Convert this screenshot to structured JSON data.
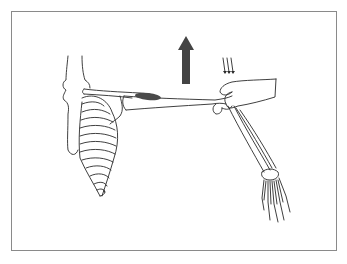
{
  "figure": {
    "colors": {
      "border": "#8a8a8a",
      "line": "#2a2a2a",
      "muscle": "#4a4a4a",
      "arrow": "#444444",
      "background": "#ffffff"
    },
    "elements": {
      "up_arrow": "upward-force-arrow",
      "down_arrows": "downward-resistance-arrows",
      "muscle": "shaded-muscle",
      "hand": "examiner-hand"
    }
  }
}
